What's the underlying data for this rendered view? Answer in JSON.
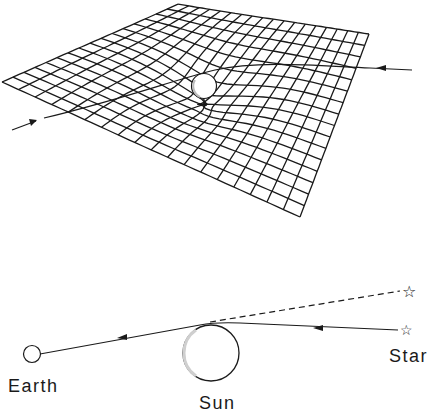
{
  "figure": {
    "top_panel": {
      "description": "Curved spacetime grid with massive sphere and bent light path",
      "grid": {
        "rows": 16,
        "cols": 18
      },
      "arrows": [
        "incoming-right",
        "outgoing-left"
      ]
    },
    "bottom_panel": {
      "labels": {
        "earth": "Earth",
        "sun": "Sun",
        "star": "Star"
      },
      "apparent_star_icon": "☆",
      "actual_star_icon": "☆"
    }
  },
  "colors": {
    "line": "#1a1a1a",
    "background": "#ffffff",
    "sun_shade": "#cfcfcf"
  }
}
